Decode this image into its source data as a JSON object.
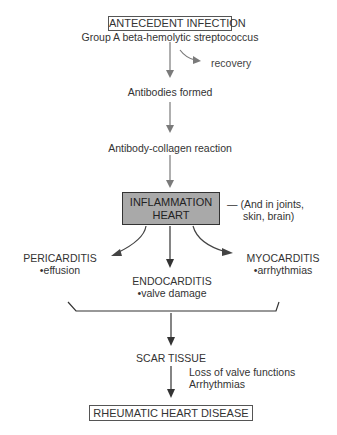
{
  "diagram": {
    "antecedent": {
      "title": "ANTECEDENT INFECTION",
      "subtitle": "Group A beta-hemolytic streptococcus"
    },
    "recovery": "recovery",
    "antibodies": "Antibodies formed",
    "reaction": "Antibody-collagen reaction",
    "inflammation": {
      "line1": "INFLAMMATION",
      "line2": "HEART",
      "note_line1": "— (And in joints,",
      "note_line2": "skin, brain)"
    },
    "pericarditis": {
      "title": "PERICARDITIS",
      "detail": "•effusion"
    },
    "endocarditis": {
      "title": "ENDOCARDITIS",
      "detail": "•valve damage"
    },
    "myocarditis": {
      "title": "MYOCARDITIS",
      "detail": "•arrhythmias"
    },
    "scar": "SCAR TISSUE",
    "consequences": [
      "Loss of valve functions",
      "Arrhythmias"
    ],
    "outcome": "RHEUMATIC HEART DISEASE"
  },
  "colors": {
    "text": "#333333",
    "arrow_gray": "#7a7a7a",
    "arrow_dark": "#333333",
    "inflammation_fill": "#a9a9a9"
  }
}
